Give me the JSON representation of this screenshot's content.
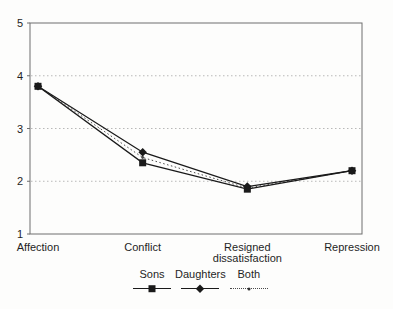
{
  "chart_data": {
    "type": "line",
    "title": "",
    "xlabel": "",
    "ylabel": "",
    "categories": [
      "Affection",
      "Conflict",
      "Resigned dissatisfaction",
      "Repression"
    ],
    "series": [
      {
        "name": "Sons",
        "marker": "square",
        "line_style": "solid",
        "color": "#1a1a1a",
        "values": [
          3.8,
          2.35,
          1.85,
          2.2
        ]
      },
      {
        "name": "Daughters",
        "marker": "diamond",
        "line_style": "solid",
        "color": "#1a1a1a",
        "values": [
          3.8,
          2.55,
          1.9,
          2.2
        ]
      },
      {
        "name": "Both",
        "marker": "dot",
        "line_style": "dotted",
        "color": "#4a4a4a",
        "values": [
          3.8,
          2.45,
          1.87,
          2.2
        ]
      }
    ],
    "ylim": [
      1,
      5
    ],
    "yticks": [
      1,
      2,
      3,
      4,
      5
    ],
    "grid": "horizontal-dotted",
    "legend_position": "bottom-center"
  },
  "colors": {
    "background": "#fdfdfc",
    "grid": "#b8b8b8",
    "border": "#6e6e6e",
    "series_line": "#1a1a1a",
    "text": "#1f1f1f"
  }
}
